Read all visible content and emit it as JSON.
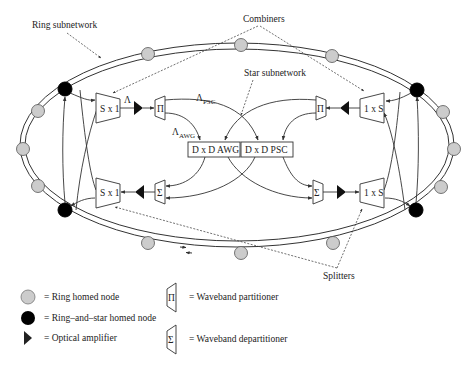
{
  "labels": {
    "ring_subnetwork": "Ring subnetwork",
    "combiners": "Combiners",
    "star_subnetwork": "Star subnetwork",
    "splitters": "Splitters"
  },
  "blocks": {
    "combiner_top_left": "S x 1",
    "combiner_bottom_left": "S x 1",
    "splitter_top_right": "1 x S",
    "splitter_bottom_right": "1 x S",
    "partitioner_symbol": "Π",
    "departitioner_symbol": "Σ",
    "awg": "D x D AWG",
    "psc": "D x D PSC"
  },
  "wavebands": {
    "lambda": "Λ",
    "psc_sub": "PSC",
    "awg_sub": "AWG"
  },
  "legend": {
    "items": [
      {
        "symbol": "gray-circle",
        "text": "= Ring homed node"
      },
      {
        "symbol": "black-circle",
        "text": "= Ring–and–star homed node"
      },
      {
        "symbol": "triangle",
        "text": "= Optical amplifier"
      },
      {
        "symbol": "partitioner",
        "glyph": "Π",
        "text": "= Waveband partitioner"
      },
      {
        "symbol": "departitioner",
        "glyph": "Σ",
        "text": "= Waveband departitioner"
      }
    ]
  },
  "colors": {
    "line": "#333333",
    "ring_node_fill": "#cccccc",
    "star_node_fill": "#000000",
    "amplifier_fill": "#111111"
  }
}
